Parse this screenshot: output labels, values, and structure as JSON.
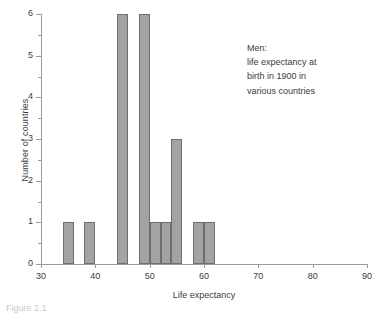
{
  "chart_data": {
    "type": "bar",
    "title": "",
    "subtitle": "",
    "xlabel": "Life expectancy",
    "ylabel": "Number of countries",
    "xlim": [
      30,
      90
    ],
    "ylim": [
      0,
      6
    ],
    "grid": false,
    "legend": "none",
    "bin_width": 2,
    "xticks": [
      30,
      40,
      50,
      60,
      70,
      80,
      90
    ],
    "yticks": [
      0,
      1,
      2,
      3,
      4,
      5,
      6
    ],
    "y_minor_ticks": [
      0.5,
      1.5,
      2.5,
      3.5,
      4.5,
      5.5
    ],
    "bar_color": "#a3a3a3",
    "bar_edge_color": "#6e6e6e",
    "axis_color": "#9a9a9a",
    "bins": [
      {
        "start": 34,
        "end": 36,
        "value": 1
      },
      {
        "start": 38,
        "end": 40,
        "value": 1
      },
      {
        "start": 44,
        "end": 46,
        "value": 6
      },
      {
        "start": 48,
        "end": 50,
        "value": 6
      },
      {
        "start": 50,
        "end": 52,
        "value": 1
      },
      {
        "start": 52,
        "end": 54,
        "value": 1
      },
      {
        "start": 54,
        "end": 56,
        "value": 3
      },
      {
        "start": 58,
        "end": 60,
        "value": 1
      },
      {
        "start": 60,
        "end": 62,
        "value": 1
      }
    ],
    "categories": [
      "34-36",
      "38-40",
      "44-46",
      "48-50",
      "50-52",
      "52-54",
      "54-56",
      "58-60",
      "60-62"
    ],
    "values": [
      1,
      1,
      6,
      6,
      1,
      1,
      3,
      1,
      1
    ],
    "annotation": {
      "lines": [
        "Men:",
        "life expectancy at",
        "birth in 1900 in",
        "various countries"
      ]
    }
  },
  "caption": {
    "text": "Figure 2.1"
  }
}
